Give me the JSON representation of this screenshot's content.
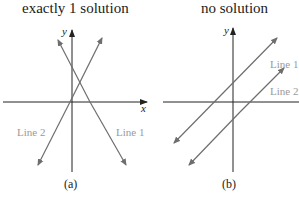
{
  "panels": [
    {
      "id": "a",
      "title": "exactly 1 solution",
      "caption": "(a)",
      "axes": {
        "x_label": "x",
        "y_label": "y"
      },
      "lines": [
        {
          "label": "Line 1",
          "description": "negative slope, intersects Line 2"
        },
        {
          "label": "Line 2",
          "description": "positive slope, intersects Line 1"
        }
      ]
    },
    {
      "id": "b",
      "title": "no solution",
      "caption": "(b)",
      "axes": {
        "y_label": "y"
      },
      "lines": [
        {
          "label": "Line 1",
          "description": "positive slope, parallel to Line 2"
        },
        {
          "label": "Line 2",
          "description": "positive slope, parallel to Line 1"
        }
      ]
    }
  ],
  "colors": {
    "axis": "#222222",
    "line": "#6e6e6e",
    "line_label": "#9a9a9a"
  }
}
